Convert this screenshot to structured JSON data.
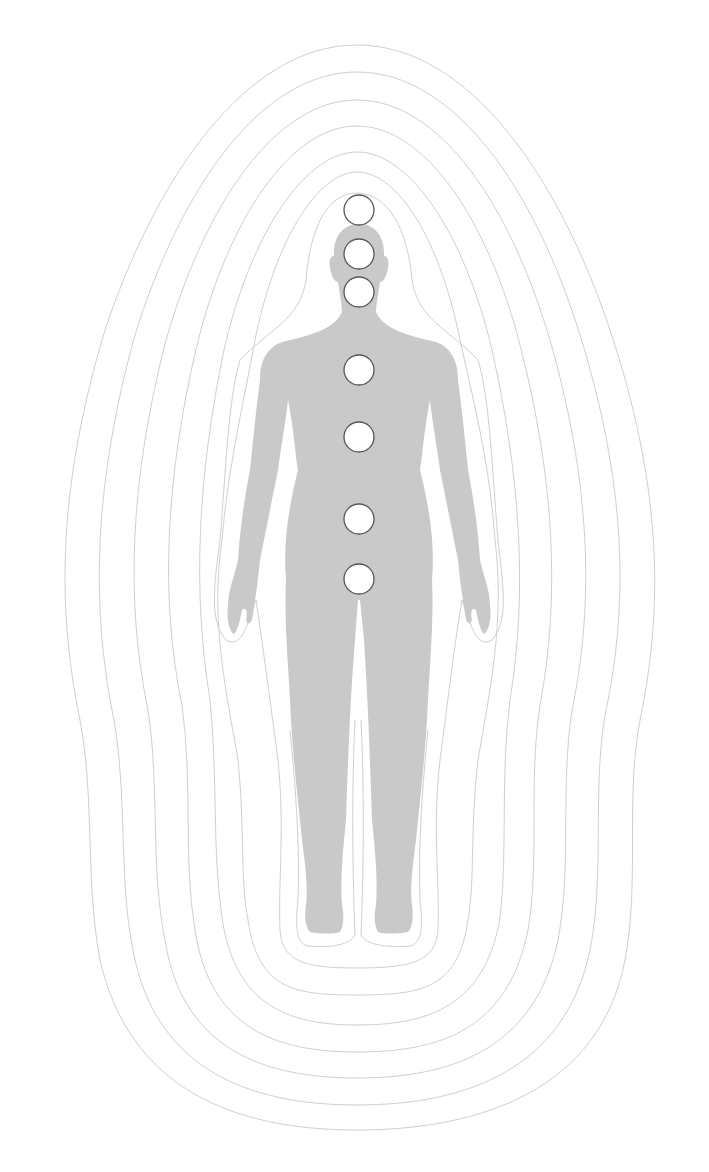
{
  "diagram": {
    "colors": {
      "background": "#ffffff",
      "body": "#c9c9c9",
      "aura_line": "#cfcfcf",
      "chakra_fill": "#ffffff",
      "chakra_stroke": "#555555"
    },
    "aura_layers": 8,
    "chakras": [
      {
        "name": "crown",
        "cx": 359,
        "cy": 210,
        "r": 15
      },
      {
        "name": "third-eye",
        "cx": 359,
        "cy": 254,
        "r": 15
      },
      {
        "name": "throat",
        "cx": 359,
        "cy": 292,
        "r": 15
      },
      {
        "name": "heart",
        "cx": 359,
        "cy": 370,
        "r": 15
      },
      {
        "name": "solar-plexus",
        "cx": 359,
        "cy": 437,
        "r": 15
      },
      {
        "name": "sacral",
        "cx": 359,
        "cy": 519,
        "r": 15
      },
      {
        "name": "root",
        "cx": 359,
        "cy": 579,
        "r": 15
      }
    ]
  }
}
